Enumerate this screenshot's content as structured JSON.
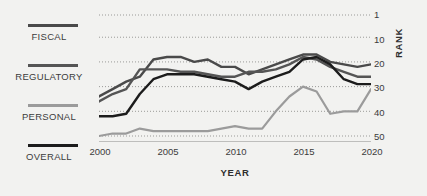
{
  "theme": {
    "background": "#f2f2f0",
    "text": "#3c3c3c",
    "axis": "#8a8a88",
    "gridline": "#9a9a98"
  },
  "legend": {
    "position": "left",
    "items": [
      {
        "label": "FISCAL",
        "color": "#4a4a4a"
      },
      {
        "label": "REGULATORY",
        "color": "#555555"
      },
      {
        "label": "PERSONAL",
        "color": "#9b9b9b"
      },
      {
        "label": "OVERALL",
        "color": "#1c1c1c"
      }
    ]
  },
  "axes": {
    "ylabel": "RANK",
    "xlabel": "YEAR",
    "yticks": [
      "1",
      "10",
      "20",
      "30",
      "40",
      "50"
    ],
    "xticks": [
      "2000",
      "2005",
      "2010",
      "2015",
      "2020"
    ]
  },
  "chart_data": {
    "type": "line",
    "title": "",
    "subtitle": "",
    "xlabel": "YEAR",
    "ylabel": "RANK",
    "xlim": [
      2000,
      2020
    ],
    "ylim": [
      1,
      50
    ],
    "y_inverted": true,
    "grid": "horizontal-dotted",
    "legend_position": "left",
    "yticks": [
      1,
      10,
      20,
      30,
      40,
      50
    ],
    "xticks": [
      2000,
      2005,
      2010,
      2015,
      2020
    ],
    "x": [
      2000,
      2001,
      2002,
      2003,
      2004,
      2005,
      2006,
      2007,
      2008,
      2009,
      2010,
      2011,
      2012,
      2013,
      2014,
      2015,
      2016,
      2017,
      2018,
      2019,
      2020
    ],
    "series": [
      {
        "name": "FISCAL",
        "color": "#4a4a4a",
        "values": [
          34,
          31,
          28,
          26,
          19,
          18,
          18,
          20,
          19,
          22,
          22,
          25,
          23,
          21,
          19,
          17,
          17,
          20,
          21,
          22,
          21
        ]
      },
      {
        "name": "REGULATORY",
        "color": "#555555",
        "values": [
          36,
          33,
          31,
          23,
          23,
          23,
          24,
          24,
          25,
          26,
          26,
          24,
          24,
          23,
          21,
          18,
          19,
          22,
          24,
          26,
          26
        ]
      },
      {
        "name": "PERSONAL",
        "color": "#9b9b9b",
        "values": [
          50,
          49,
          49,
          47,
          48,
          48,
          48,
          48,
          48,
          47,
          46,
          47,
          47,
          40,
          34,
          30,
          32,
          41,
          40,
          40,
          31
        ]
      },
      {
        "name": "OVERALL",
        "color": "#1c1c1c",
        "values": [
          42,
          42,
          41,
          33,
          27,
          25,
          25,
          25,
          26,
          27,
          28,
          31,
          28,
          26,
          24,
          19,
          18,
          21,
          27,
          29,
          29
        ]
      }
    ]
  }
}
